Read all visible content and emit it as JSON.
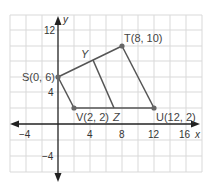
{
  "figure": {
    "type": "coordinate-plane-quadrilateral",
    "axes": {
      "x_label": "x",
      "y_label": "y",
      "x_ticks": [
        {
          "value": -4,
          "label": "−4"
        },
        {
          "value": 4,
          "label": "4"
        },
        {
          "value": 8,
          "label": "8"
        },
        {
          "value": 12,
          "label": "12"
        },
        {
          "value": 16,
          "label": "16"
        }
      ],
      "y_ticks": [
        {
          "value": 12,
          "label": "12"
        },
        {
          "value": 4,
          "label": "4"
        },
        {
          "value": -4,
          "label": "−4"
        }
      ],
      "grid_step": 2,
      "x_range": [
        -6,
        18
      ],
      "y_range": [
        -6,
        14
      ]
    },
    "points": {
      "S": {
        "name": "S",
        "label": "S(0, 6)",
        "x": 0,
        "y": 6
      },
      "T": {
        "name": "T",
        "label": "T(8, 10)",
        "x": 8,
        "y": 10
      },
      "U": {
        "name": "U",
        "label": "U(12, 2)",
        "x": 12,
        "y": 2
      },
      "V": {
        "name": "V",
        "label": "V(2, 2)",
        "x": 2,
        "y": 2
      },
      "Y": {
        "name": "Y",
        "label": "Y",
        "x": 4.5,
        "y": 8.25
      },
      "Z": {
        "name": "Z",
        "label": "Z",
        "x": 7,
        "y": 2
      }
    },
    "segments": [
      [
        "S",
        "T"
      ],
      [
        "T",
        "U"
      ],
      [
        "U",
        "V"
      ],
      [
        "V",
        "S"
      ],
      [
        "Y",
        "Z"
      ]
    ],
    "colors": {
      "grid": "#d9d9d9",
      "axis": "#222222",
      "shape": "#555555",
      "point": "#666666"
    }
  }
}
